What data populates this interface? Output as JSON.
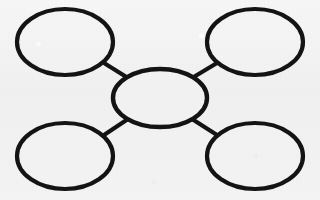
{
  "document": {
    "title": "Concept Map Graphic Organizer",
    "kind": "blank-spider-diagram",
    "background_color": "#f2f2f2",
    "ink_color": "#141414",
    "stroke_width_px": 4
  },
  "diagram": {
    "type": "concept-map",
    "center_node": {
      "id": "center",
      "label": "",
      "cx": 160,
      "cy": 98,
      "rx": 47,
      "ry": 29
    },
    "satellite_nodes": [
      {
        "id": "top-left",
        "label": "",
        "cx": 65,
        "cy": 42,
        "rx": 48,
        "ry": 33
      },
      {
        "id": "top-right",
        "label": "",
        "cx": 255,
        "cy": 42,
        "rx": 48,
        "ry": 33
      },
      {
        "id": "bottom-left",
        "label": "",
        "cx": 65,
        "cy": 156,
        "rx": 48,
        "ry": 33
      },
      {
        "id": "bottom-right",
        "label": "",
        "cx": 255,
        "cy": 156,
        "rx": 48,
        "ry": 33
      }
    ],
    "connectors": [
      {
        "id": "center-to-top-left",
        "from": "center",
        "to": "top-left",
        "x1": 128,
        "y1": 78,
        "x2": 104,
        "y2": 63
      },
      {
        "id": "center-to-top-right",
        "from": "center",
        "to": "top-right",
        "x1": 192,
        "y1": 78,
        "x2": 217,
        "y2": 63
      },
      {
        "id": "center-to-bottom-left",
        "from": "center",
        "to": "bottom-left",
        "x1": 128,
        "y1": 119,
        "x2": 104,
        "y2": 135
      },
      {
        "id": "center-to-bottom-right",
        "from": "center",
        "to": "bottom-right",
        "x1": 192,
        "y1": 119,
        "x2": 217,
        "y2": 135
      }
    ]
  }
}
